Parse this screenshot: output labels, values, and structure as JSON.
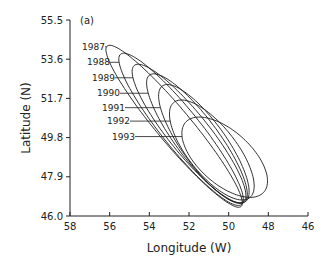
{
  "chart_data": {
    "type": "scatter",
    "subtype": "ellipses",
    "panel_label": "(a)",
    "xlabel": "Longitude (W)",
    "ylabel": "Latitude (N)",
    "xlim": [
      58,
      46
    ],
    "ylim": [
      46.0,
      55.5
    ],
    "x_ticks": [
      "58",
      "56",
      "54",
      "52",
      "50",
      "48",
      "46"
    ],
    "x_tick_values": [
      58,
      56,
      54,
      52,
      50,
      48,
      46
    ],
    "y_ticks": [
      "46.0",
      "47.9",
      "49.8",
      "51.7",
      "53.6",
      "55.5"
    ],
    "y_tick_values": [
      46.0,
      47.9,
      49.8,
      51.7,
      53.6,
      55.5
    ],
    "grid": false,
    "series": [
      {
        "name": "1987",
        "center_lon": 52.75,
        "center_lat": 50.35,
        "semi_major_deg": 5.15,
        "semi_minor_deg": 0.85,
        "angle_deg": -49
      },
      {
        "name": "1988",
        "center_lon": 52.4,
        "center_lat": 50.2,
        "semi_major_deg": 4.75,
        "semi_minor_deg": 0.95,
        "angle_deg": -50
      },
      {
        "name": "1989",
        "center_lon": 52.0,
        "center_lat": 50.0,
        "semi_major_deg": 4.3,
        "semi_minor_deg": 1.0,
        "angle_deg": -50
      },
      {
        "name": "1990",
        "center_lon": 51.6,
        "center_lat": 49.75,
        "semi_major_deg": 3.9,
        "semi_minor_deg": 1.05,
        "angle_deg": -52
      },
      {
        "name": "1991",
        "center_lon": 51.25,
        "center_lat": 49.5,
        "semi_major_deg": 3.5,
        "semi_minor_deg": 1.1,
        "angle_deg": -53
      },
      {
        "name": "1992",
        "center_lon": 50.85,
        "center_lat": 49.2,
        "semi_major_deg": 3.0,
        "semi_minor_deg": 1.2,
        "angle_deg": -50
      },
      {
        "name": "1993",
        "center_lon": 50.2,
        "center_lat": 48.85,
        "semi_major_deg": 2.6,
        "semi_minor_deg": 1.3,
        "angle_deg": -40
      }
    ],
    "labels": [
      {
        "text": "1987",
        "lat": 54.2
      },
      {
        "text": "1988",
        "lat": 53.45
      },
      {
        "text": "1989",
        "lat": 52.7
      },
      {
        "text": "1990",
        "lat": 51.95
      },
      {
        "text": "1991",
        "lat": 51.25
      },
      {
        "text": "1992",
        "lat": 50.6
      },
      {
        "text": "1993",
        "lat": 49.85
      }
    ]
  }
}
